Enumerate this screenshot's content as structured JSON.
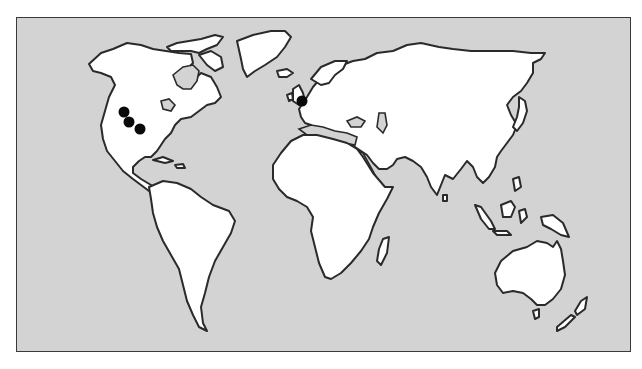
{
  "map": {
    "type": "world-outline-map",
    "projection": "equirectangular-style",
    "ocean_color": "#d3d3d3",
    "land_color": "#ffffff",
    "outline_color": "#2a2a2a",
    "marker_color": "#0a0a0a",
    "continents": [
      "North America",
      "Greenland",
      "South America",
      "Europe",
      "Africa",
      "Asia",
      "Australia",
      "New Zealand",
      "Madagascar"
    ],
    "markers": [
      {
        "id": "m1",
        "region": "Western United States (north)",
        "x": 123,
        "y": 111
      },
      {
        "id": "m2",
        "region": "Western United States (central)",
        "x": 128,
        "y": 121
      },
      {
        "id": "m3",
        "region": "Western United States (south)",
        "x": 139,
        "y": 128
      },
      {
        "id": "m4",
        "region": "Southern England / English Channel",
        "x": 301,
        "y": 100
      }
    ]
  }
}
